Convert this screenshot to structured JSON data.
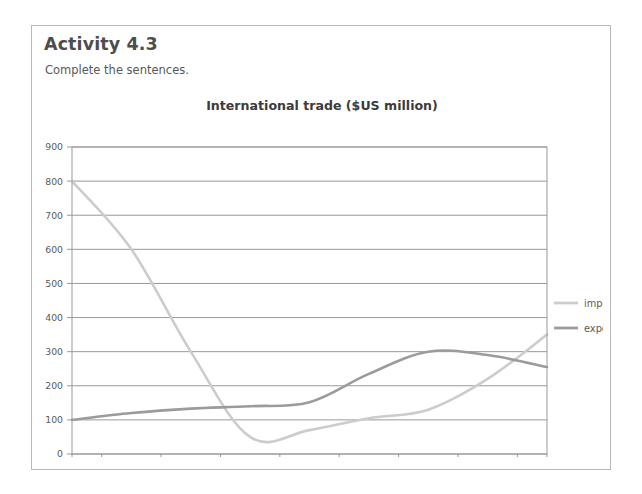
{
  "activity": {
    "title": "Activity 4.3",
    "instruction": "Complete the sentences."
  },
  "colors": {
    "imports_line": "#cccccc",
    "exports_line": "#9b9b9b",
    "gridline": "#8d8d8d",
    "plot_border": "#9a9a9a",
    "card_border": "#b9b9b9",
    "axis_text": "#5a5a5a",
    "title_text": "#3b3b3b",
    "heading_text": "#4d4d4d"
  },
  "chart_data": {
    "type": "line",
    "title": "International trade ($US million)",
    "xlabel": "",
    "ylabel": "",
    "categories": [
      "2002",
      "2003",
      "2004",
      "2005",
      "2006",
      "2007",
      "2008",
      "2009",
      "2010"
    ],
    "x": [
      2002,
      2003,
      2004,
      2005,
      2006,
      2007,
      2008,
      2009,
      2010
    ],
    "ylim": [
      0,
      900
    ],
    "xlim": [
      2002,
      2010
    ],
    "yticks": [
      0,
      100,
      200,
      300,
      400,
      500,
      600,
      700,
      800,
      900
    ],
    "ytick_labels": [
      "0",
      "100",
      "200",
      "300",
      "400",
      "500",
      "600",
      "700",
      "800",
      "900"
    ],
    "grid": true,
    "grid_axis": "y",
    "legend_position": "right",
    "series": [
      {
        "name": "imports",
        "color": "#cccccc",
        "values": [
          800,
          600,
          300,
          50,
          70,
          105,
          130,
          220,
          350
        ]
      },
      {
        "name": "exports",
        "color": "#9b9b9b",
        "values": [
          100,
          120,
          133,
          140,
          152,
          235,
          300,
          290,
          255
        ]
      }
    ]
  },
  "legend": {
    "items": [
      {
        "label": "imports",
        "color": "#cccccc"
      },
      {
        "label": "exports",
        "color": "#9b9b9b"
      }
    ]
  }
}
